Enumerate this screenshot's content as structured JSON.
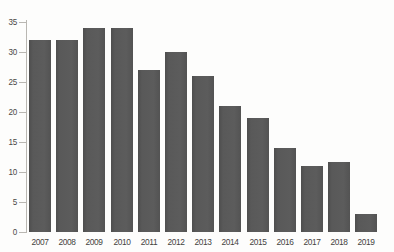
{
  "chart_data": {
    "type": "bar",
    "title": "",
    "subtitle": "",
    "xlabel": "",
    "ylabel": "",
    "categories": [
      "2007",
      "2008",
      "2009",
      "2010",
      "2011",
      "2012",
      "2013",
      "2014",
      "2015",
      "2016",
      "2017",
      "2018",
      "2019"
    ],
    "values": [
      32,
      32,
      34,
      34,
      27,
      30,
      26,
      21,
      19,
      14,
      11,
      11.7,
      3
    ],
    "series": [
      {
        "name": "",
        "values": [
          32,
          32,
          34,
          34,
          27,
          30,
          26,
          21,
          19,
          14,
          11,
          11.7,
          3
        ]
      }
    ],
    "ylim": [
      0,
      35
    ],
    "yticks": [
      0,
      5,
      10,
      15,
      20,
      25,
      30,
      35
    ],
    "ytick_labels": [
      "0",
      "5",
      "10",
      "15",
      "20",
      "25",
      "30",
      "35"
    ],
    "grid": false,
    "legend": "none",
    "bar_color": "#585858",
    "background_color": "#fdfdfc",
    "axis_color": "#b9b7b2",
    "tick_label_color": "#45433f"
  }
}
